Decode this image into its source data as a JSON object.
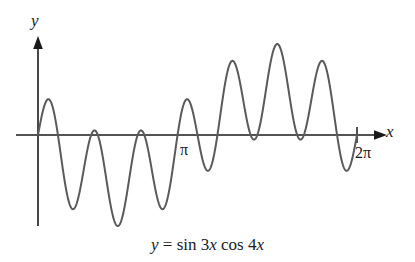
{
  "figure": {
    "background_color": "#ffffff",
    "curve_color": "#5a5a5a",
    "axis_color": "#1a1a1a",
    "caption": "y = sin 3x cos 4x",
    "caption_parts": {
      "lhs": "y",
      "equals": " = sin 3",
      "var1": "x",
      "mid": " cos 4",
      "var2": "x"
    }
  },
  "axes": {
    "y_label": "y",
    "x_label": "x",
    "x_ticks": [
      {
        "label": "π",
        "value": 3.14159
      },
      {
        "label": "2π",
        "value": 6.28319
      }
    ]
  },
  "chart_data": {
    "type": "line",
    "title": "",
    "subtitle": "",
    "caption": "y = sin 3x cos 4x",
    "expression": "y = sin(3x) * cos(4x)",
    "xlabel": "x",
    "ylabel": "y",
    "xlim": [
      0,
      6.28319
    ],
    "ylim": [
      -1,
      1
    ],
    "grid": false,
    "legend": null,
    "tick_labels": {
      "x": [
        "π",
        "2π"
      ],
      "y": []
    },
    "annotations": [],
    "series": [
      {
        "name": "y = sin 3x cos 4x",
        "color": "#5a5a5a",
        "n_samples": 1400,
        "x_start": 0,
        "x_end": 6.28319,
        "formula": "sin(3*x)*cos(4*x)",
        "key_points": [
          {
            "x": 0.0,
            "y": 0.0,
            "kind": "start-zero"
          },
          {
            "x": 0.449,
            "y": 0.79,
            "kind": "local-max"
          },
          {
            "x": 0.898,
            "y": 0.0,
            "kind": "zero"
          },
          {
            "x": 1.16,
            "y": -0.98,
            "kind": "local-min"
          },
          {
            "x": 1.571,
            "y": 0.0,
            "kind": "zero"
          },
          {
            "x": 1.72,
            "y": 0.29,
            "kind": "local-max"
          },
          {
            "x": 1.98,
            "y": 0.0,
            "kind": "zero"
          },
          {
            "x": 2.27,
            "y": -1.0,
            "kind": "local-min"
          },
          {
            "x": 2.69,
            "y": 0.0,
            "kind": "zero"
          },
          {
            "x": 2.98,
            "y": 0.62,
            "kind": "local-max"
          },
          {
            "x": 3.14159,
            "y": 0.0,
            "kind": "zero-at-pi"
          },
          {
            "x": 3.38,
            "y": -0.62,
            "kind": "local-min"
          },
          {
            "x": 3.59,
            "y": 0.0,
            "kind": "zero"
          },
          {
            "x": 3.87,
            "y": 0.93,
            "kind": "local-max"
          },
          {
            "x": 4.19,
            "y": 0.0,
            "kind": "zero"
          },
          {
            "x": 4.4,
            "y": -0.29,
            "kind": "local-min"
          },
          {
            "x": 4.71,
            "y": 0.0,
            "kind": "zero"
          },
          {
            "x": 4.97,
            "y": 1.0,
            "kind": "global-max"
          },
          {
            "x": 5.38,
            "y": 0.0,
            "kind": "zero"
          },
          {
            "x": 5.57,
            "y": 0.79,
            "kind": "local-max"
          },
          {
            "x": 5.89,
            "y": 0.0,
            "kind": "zero"
          },
          {
            "x": 6.1,
            "y": -0.85,
            "kind": "local-min"
          },
          {
            "x": 6.28319,
            "y": 0.0,
            "kind": "end-zero"
          }
        ]
      }
    ]
  }
}
